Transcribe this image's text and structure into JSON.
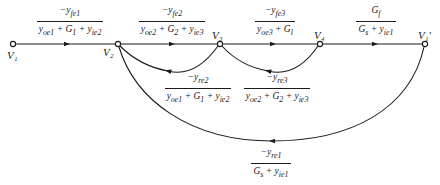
{
  "figure": {
    "type": "signal-flow-graph",
    "nodes": [
      {
        "id": "V1",
        "label": "V₁"
      },
      {
        "id": "V2",
        "label": "V₂"
      },
      {
        "id": "V3",
        "label": "V₃"
      },
      {
        "id": "V4",
        "label": "V₄"
      },
      {
        "id": "V1p",
        "label": "V₁′"
      }
    ],
    "branches": [
      {
        "from": "V1",
        "to": "V2",
        "num": "−y_fe1",
        "den": "y_oe1 + G_1 + y_ie2",
        "num_html": "−y<sub>fe1</sub>",
        "den_html": "y<sub>oe1</sub> + G<sub>1</sub> + y<sub>ie2</sub>"
      },
      {
        "from": "V2",
        "to": "V3",
        "num": "−y_fe2",
        "den": "y_oe2 + G_2 + y_ie3",
        "num_html": "−y<sub>fe2</sub>",
        "den_html": "y<sub>oe2</sub> + G<sub>2</sub> + y<sub>ie3</sub>"
      },
      {
        "from": "V3",
        "to": "V4",
        "num": "−y_fe3",
        "den": "y_oe3 + G_l",
        "num_html": "−y<sub>fe3</sub>",
        "den_html": "y<sub>oe3</sub> + G<sub>l</sub>"
      },
      {
        "from": "V4",
        "to": "V1p",
        "num": "G_f",
        "den": "G_s + y_ie1",
        "num_html": "G<sub>f</sub>",
        "den_html": "G<sub>s</sub> + y<sub>ie1</sub>"
      },
      {
        "from": "V3",
        "to": "V2",
        "num": "−y_re2",
        "den": "y_oe1 + G_1 + y_ie2",
        "num_html": "−y<sub>re2</sub>",
        "den_html": "y<sub>oe1</sub> + G<sub>1</sub> + y<sub>ie2</sub>"
      },
      {
        "from": "V4",
        "to": "V3",
        "num": "−y_re3",
        "den": "y_oe2 + G_2 + y_ie3",
        "num_html": "−y<sub>re3</sub>",
        "den_html": "y<sub>oe2</sub> + G<sub>2</sub> + y<sub>ie3</sub>"
      },
      {
        "from": "V1p",
        "to": "V2",
        "num": "−y_re1",
        "den": "G_s + y_ie1",
        "num_html": "−y<sub>re1</sub>",
        "den_html": "G<sub>s</sub> + y<sub>ie1</sub>"
      }
    ]
  }
}
